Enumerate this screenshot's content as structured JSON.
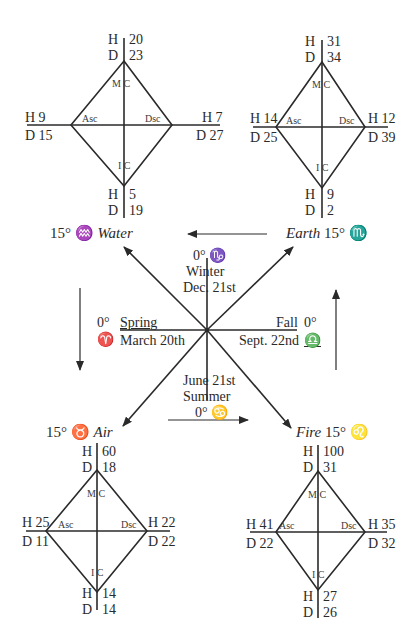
{
  "diagram": {
    "title": "",
    "center": {
      "top": {
        "degree": "0°",
        "sign_glyph": "♑",
        "season": "Winter",
        "date": "Dec. 21st"
      },
      "bottom": {
        "degree": "0°",
        "sign_glyph": "♋",
        "season": "Summer",
        "date": "June 21st"
      },
      "left": {
        "degree": "0°",
        "sign_glyph": "♈",
        "season": "Spring",
        "date": "March 20th"
      },
      "right": {
        "degree": "0°",
        "sign_glyph": "♎",
        "season": "Fall",
        "date": "Sept. 22nd"
      }
    },
    "quadrants": {
      "water": {
        "element": "Water",
        "degree": "15°",
        "sign_glyph": "♒",
        "mc": {
          "H": "H",
          "D": "D",
          "h": "20",
          "d": "23"
        },
        "asc": {
          "h": "H 9",
          "d": "D 15"
        },
        "dsc": {
          "h": "H 7",
          "d": "D 27"
        },
        "ic": {
          "H": "H",
          "D": "D",
          "h": "5",
          "d": "19"
        }
      },
      "earth": {
        "element": "Earth",
        "degree": "15°",
        "sign_glyph": "♏",
        "mc": {
          "H": "H",
          "D": "D",
          "h": "31",
          "d": "34"
        },
        "asc": {
          "h": "H 14",
          "d": "D 25"
        },
        "dsc": {
          "h": "H 12",
          "d": "D 39"
        },
        "ic": {
          "H": "H",
          "D": "D",
          "h": "9",
          "d": "2"
        }
      },
      "air": {
        "element": "Air",
        "degree": "15°",
        "sign_glyph": "♉",
        "mc": {
          "H": "H",
          "D": "D",
          "h": "60",
          "d": "18"
        },
        "asc": {
          "h": "H 25",
          "d": "D 11"
        },
        "dsc": {
          "h": "H 22",
          "d": "D 22"
        },
        "ic": {
          "H": "H",
          "D": "D",
          "h": "14",
          "d": "14"
        }
      },
      "fire": {
        "element": "Fire",
        "degree": "15°",
        "sign_glyph": "♌",
        "mc": {
          "H": "H",
          "D": "D",
          "h": "100",
          "d": "31"
        },
        "asc": {
          "h": "H 41",
          "d": "D 22"
        },
        "dsc": {
          "h": "H 35",
          "d": "D 32"
        },
        "ic": {
          "H": "H",
          "D": "D",
          "h": "27",
          "d": "26"
        }
      }
    },
    "angle_labels": {
      "mc": "M C",
      "ic": "I C",
      "asc": "Asc",
      "dsc": "Dsc"
    }
  }
}
